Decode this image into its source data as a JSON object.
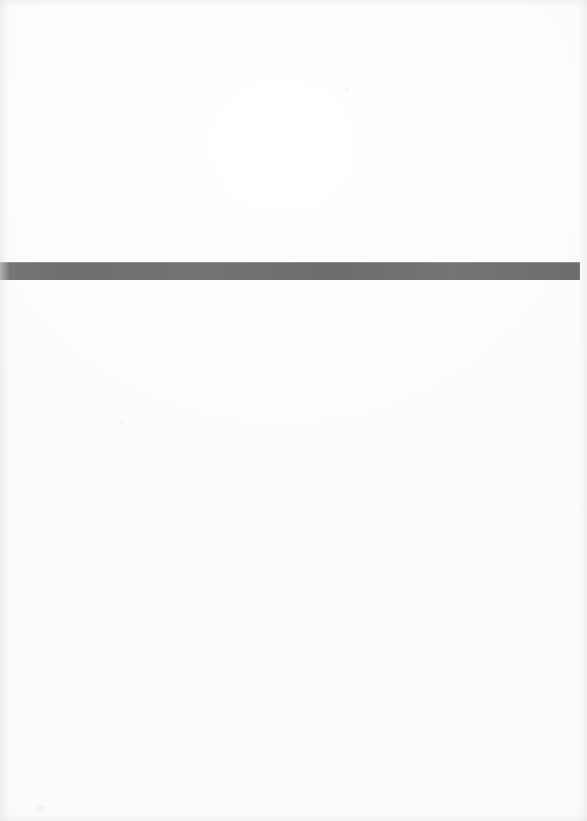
{
  "page": {
    "kind": "scanned-blank-page",
    "width": 587,
    "height": 821,
    "background_color": "#fdfdfd",
    "content_text": "",
    "notes": ""
  },
  "divider": {
    "name": "horizontal-gray-band",
    "color": "#6e6f70",
    "x": 0,
    "y": 262,
    "width": 580,
    "height": 18,
    "label": ""
  },
  "artifacts": {
    "speck_color": "#f2f2f3",
    "count": 4
  }
}
